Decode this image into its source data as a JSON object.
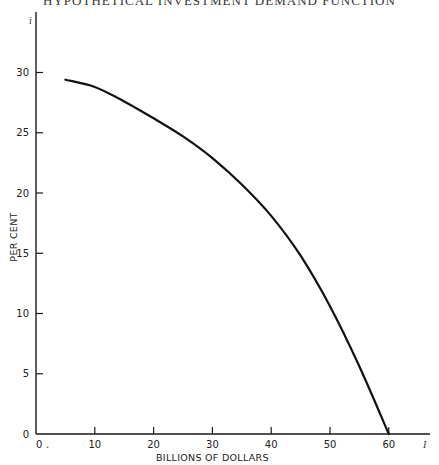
{
  "chart_data": {
    "type": "line",
    "title": "HYPOTHETICAL INVESTMENT DEMAND FUNCTION",
    "xlabel": "BILLIONS OF DOLLARS",
    "ylabel": "PER CENT",
    "xlim": [
      0,
      65
    ],
    "ylim": [
      0,
      33
    ],
    "x_ticks": [
      0,
      10,
      20,
      30,
      40,
      50,
      60
    ],
    "y_ticks": [
      0,
      5,
      10,
      15,
      20,
      25,
      30
    ],
    "x_tick_labels": [
      "0",
      "10",
      "20",
      "30",
      "40",
      "50",
      "60"
    ],
    "y_tick_labels": [
      "0",
      "5",
      "10",
      "15",
      "20",
      "25",
      "30"
    ],
    "axis_end_marks": {
      "y": "i",
      "x": "I"
    },
    "grid": false,
    "legend": null,
    "series": [
      {
        "name": "Investment demand",
        "x": [
          5,
          10,
          15,
          20,
          25,
          30,
          35,
          40,
          45,
          50,
          55,
          60
        ],
        "y": [
          29.4,
          28.8,
          27.6,
          26.2,
          24.7,
          22.9,
          20.7,
          18.1,
          14.8,
          10.6,
          5.6,
          0
        ]
      }
    ]
  }
}
